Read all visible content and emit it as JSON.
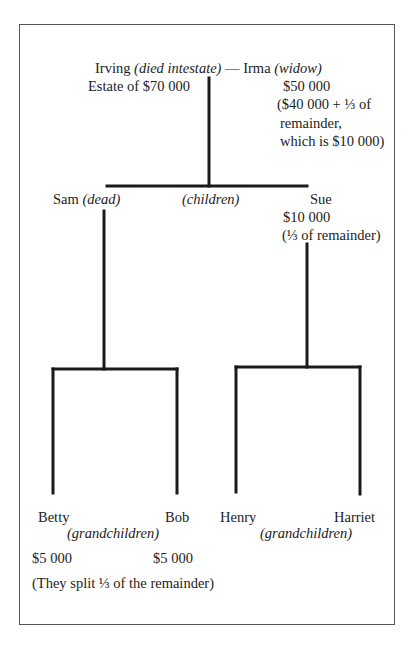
{
  "diagram": {
    "type": "family-tree",
    "root": {
      "name": "Irving",
      "note": "(died intestate)",
      "dash": "—",
      "spouse": "Irma",
      "spouse_note": "(widow)",
      "estate": "Estate of $70 000",
      "spouse_share": "$50 000",
      "spouse_share_explanation": [
        "($40 000 + ⅓ of",
        "remainder,",
        "which is $10 000)"
      ]
    },
    "children_label": "(children)",
    "children": [
      {
        "name": "Sam",
        "note": "(dead)"
      },
      {
        "name": "Sue",
        "share": "$10 000",
        "share_explanation": "(⅓ of remainder)"
      }
    ],
    "grandchildren_label": "(grandchildren)",
    "grandchildren": [
      {
        "name": "Betty",
        "parent": "Sam",
        "share": "$5 000"
      },
      {
        "name": "Bob",
        "parent": "Sam",
        "share": "$5 000"
      },
      {
        "name": "Henry",
        "parent": "Sue"
      },
      {
        "name": "Harriet",
        "parent": "Sue"
      }
    ],
    "footnote": "(They split ⅓ of the remainder)",
    "line_color": "#1a1a1a"
  }
}
